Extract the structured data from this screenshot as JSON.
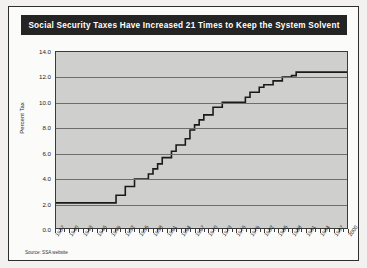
{
  "document": {
    "title_banner": "Social Security Taxes Have Increased 21 Times to Keep the System Solvent",
    "source_note": "Source: SSA website"
  },
  "chart_data": {
    "type": "line",
    "title": "Social Security Taxes Have Increased 21 Times to Keep the System Solvent",
    "xlabel": "",
    "ylabel": "Percent Tax",
    "ylim": [
      0.0,
      14.0
    ],
    "ytick_labels": [
      "0.0",
      "2.0",
      "4.0",
      "6.0",
      "8.0",
      "10.0",
      "12.0",
      "14.0"
    ],
    "ytick_values": [
      0.0,
      2.0,
      4.0,
      6.0,
      8.0,
      10.0,
      12.0,
      14.0
    ],
    "xlim": [
      1937,
      2000
    ],
    "xtick_labels": [
      "1937",
      "1940",
      "1943",
      "1946",
      "1949",
      "1952",
      "1955",
      "1958",
      "1961",
      "1964",
      "1967",
      "1970",
      "1973",
      "1976",
      "1979",
      "1982",
      "1985",
      "1988",
      "1991",
      "1994",
      "1997",
      "2000"
    ],
    "grid": true,
    "legend": "none",
    "line_color": "#1a1a1a",
    "plot_background": "#cfcfcd",
    "series": [
      {
        "name": "Combined Social Security Tax Rate",
        "x": [
          1937,
          1938,
          1939,
          1940,
          1941,
          1942,
          1943,
          1944,
          1945,
          1946,
          1947,
          1948,
          1949,
          1950,
          1951,
          1952,
          1953,
          1954,
          1955,
          1956,
          1957,
          1958,
          1959,
          1960,
          1961,
          1962,
          1963,
          1964,
          1965,
          1966,
          1967,
          1968,
          1969,
          1970,
          1971,
          1972,
          1973,
          1974,
          1975,
          1976,
          1977,
          1978,
          1979,
          1980,
          1981,
          1982,
          1983,
          1984,
          1985,
          1986,
          1987,
          1988,
          1989,
          1990,
          1991,
          1992,
          1993,
          1994,
          1995,
          1996,
          1997,
          1998,
          1999,
          2000
        ],
        "values": [
          2.0,
          2.0,
          2.0,
          2.0,
          2.0,
          2.0,
          2.0,
          2.0,
          2.0,
          2.0,
          2.0,
          2.0,
          2.0,
          3.0,
          3.0,
          3.0,
          3.0,
          4.0,
          4.0,
          4.0,
          4.5,
          4.5,
          5.0,
          6.0,
          6.0,
          6.25,
          7.25,
          7.25,
          7.25,
          8.4,
          8.8,
          8.8,
          9.6,
          9.6,
          10.4,
          10.4,
          11.7,
          11.7,
          11.7,
          11.7,
          11.7,
          12.1,
          12.26,
          12.26,
          13.3,
          13.4,
          13.4,
          14.0,
          14.1,
          14.3,
          14.3,
          15.02,
          15.02,
          15.3,
          15.3,
          15.3,
          15.3,
          15.3,
          15.3,
          15.3,
          15.3,
          15.3,
          15.3,
          15.3
        ]
      }
    ],
    "plotted_points": [
      {
        "x": 1937,
        "y": 2.0
      },
      {
        "x": 1950,
        "y": 2.0
      },
      {
        "x": 1950,
        "y": 2.6
      },
      {
        "x": 1952,
        "y": 2.6
      },
      {
        "x": 1952,
        "y": 3.3
      },
      {
        "x": 1954,
        "y": 3.3
      },
      {
        "x": 1954,
        "y": 3.9
      },
      {
        "x": 1957,
        "y": 3.9
      },
      {
        "x": 1957,
        "y": 4.3
      },
      {
        "x": 1958,
        "y": 4.3
      },
      {
        "x": 1958,
        "y": 4.7
      },
      {
        "x": 1959,
        "y": 4.7
      },
      {
        "x": 1959,
        "y": 5.1
      },
      {
        "x": 1960,
        "y": 5.1
      },
      {
        "x": 1960,
        "y": 5.6
      },
      {
        "x": 1962,
        "y": 5.6
      },
      {
        "x": 1962,
        "y": 6.1
      },
      {
        "x": 1963,
        "y": 6.1
      },
      {
        "x": 1963,
        "y": 6.6
      },
      {
        "x": 1965,
        "y": 6.6
      },
      {
        "x": 1965,
        "y": 7.1
      },
      {
        "x": 1966,
        "y": 7.1
      },
      {
        "x": 1966,
        "y": 7.8
      },
      {
        "x": 1967,
        "y": 7.8
      },
      {
        "x": 1967,
        "y": 8.2
      },
      {
        "x": 1968,
        "y": 8.2
      },
      {
        "x": 1968,
        "y": 8.6
      },
      {
        "x": 1969,
        "y": 8.6
      },
      {
        "x": 1969,
        "y": 9.0
      },
      {
        "x": 1971,
        "y": 9.0
      },
      {
        "x": 1971,
        "y": 9.6
      },
      {
        "x": 1973,
        "y": 9.6
      },
      {
        "x": 1973,
        "y": 10.0
      },
      {
        "x": 1978,
        "y": 10.0
      },
      {
        "x": 1978,
        "y": 10.4
      },
      {
        "x": 1979,
        "y": 10.4
      },
      {
        "x": 1979,
        "y": 10.8
      },
      {
        "x": 1981,
        "y": 10.8
      },
      {
        "x": 1981,
        "y": 11.2
      },
      {
        "x": 1982,
        "y": 11.2
      },
      {
        "x": 1982,
        "y": 11.4
      },
      {
        "x": 1984,
        "y": 11.4
      },
      {
        "x": 1984,
        "y": 11.7
      },
      {
        "x": 1986,
        "y": 11.7
      },
      {
        "x": 1986,
        "y": 12.0
      },
      {
        "x": 1988,
        "y": 12.0
      },
      {
        "x": 1988,
        "y": 12.12
      },
      {
        "x": 1989,
        "y": 12.12
      },
      {
        "x": 1989,
        "y": 12.4
      },
      {
        "x": 1990,
        "y": 12.4
      },
      {
        "x": 2000,
        "y": 12.4
      }
    ]
  }
}
